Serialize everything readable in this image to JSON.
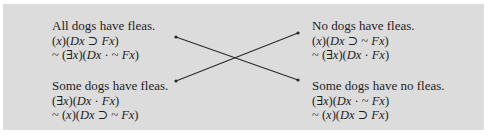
{
  "square_of_opposition": {
    "top_left": {
      "english": "All dogs have fleas.",
      "formula_1": "(x)(Dx ⊃ Fx)",
      "formula_2": "~  (∃x)(Dx · ~ Fx)"
    },
    "top_right": {
      "english": "No dogs have fleas.",
      "formula_1": "(x)(Dx ⊃ ~ Fx)",
      "formula_2": "~  (∃x)(Dx · Fx)"
    },
    "bottom_left": {
      "english": "Some dogs have fleas.",
      "formula_1": "(∃x)(Dx · Fx)",
      "formula_2": "~  (x)(Dx ⊃ ~  Fx)"
    },
    "bottom_right": {
      "english": "Some dogs have no fleas.",
      "formula_1": "(∃x)(Dx · ~ Fx)",
      "formula_2": "~ (x)(Dx ⊃ Fx)"
    }
  },
  "colors": {
    "panel_background": "#dcdcdc",
    "text": "#1e1e1e",
    "arrow": "#2a2a2a"
  }
}
